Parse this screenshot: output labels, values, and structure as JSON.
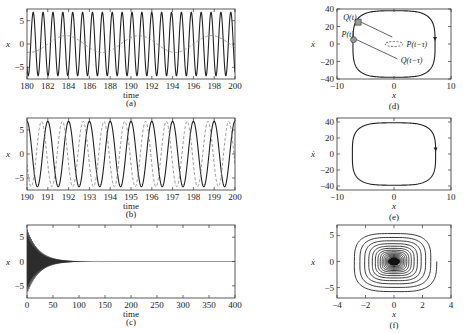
{
  "figure": {
    "width": 465,
    "height": 333
  },
  "chart_data": [
    {
      "id": "a",
      "type": "line",
      "panel_label": "(a)",
      "frame": [
        27,
        9,
        235,
        79
      ],
      "xlabel": "time",
      "ylabel": "x",
      "xlim": [
        180,
        200
      ],
      "ylim": [
        -7.5,
        7.5
      ],
      "xticks": [
        180,
        182,
        184,
        186,
        188,
        190,
        192,
        194,
        196,
        198,
        200
      ],
      "yticks": [
        -5,
        0,
        5
      ],
      "series": [
        {
          "name": "x(t)",
          "style": "solid",
          "amplitude": 6.8,
          "period": 0.95,
          "phase": 0.15
        },
        {
          "name": "delayed / reference",
          "style": "dashed",
          "amplitude": 1.8,
          "period": 7.0,
          "phase": 0.0
        }
      ]
    },
    {
      "id": "b",
      "type": "line",
      "panel_label": "(b)",
      "frame": [
        27,
        118,
        235,
        190
      ],
      "xlabel": "time",
      "ylabel": "x",
      "xlim": [
        190,
        200
      ],
      "ylim": [
        -7.5,
        7.5
      ],
      "xticks": [
        190,
        191,
        192,
        193,
        194,
        195,
        196,
        197,
        198,
        199,
        200
      ],
      "yticks": [
        -5,
        0,
        5
      ],
      "series": [
        {
          "name": "x(t)",
          "style": "solid",
          "amplitude": 6.8,
          "period": 1.0,
          "phase": 0.25
        },
        {
          "name": "x(t-τ)",
          "style": "dashed",
          "amplitude": 6.8,
          "period": 1.0,
          "phase": 0.55
        }
      ]
    },
    {
      "id": "c",
      "type": "line",
      "panel_label": "(c)",
      "frame": [
        27,
        225,
        235,
        298
      ],
      "xlabel": "time",
      "ylabel": "x",
      "xlim": [
        0,
        400
      ],
      "ylim": [
        -7.5,
        7.5
      ],
      "xticks": [
        0,
        50,
        100,
        150,
        200,
        250,
        300,
        350,
        400
      ],
      "yticks": [
        -5,
        0,
        5
      ],
      "series": [
        {
          "name": "x(t) decaying",
          "style": "solid",
          "amplitude": 6.8,
          "decay": 0.045,
          "period": 1.0
        }
      ]
    },
    {
      "id": "d",
      "type": "phase-portrait",
      "panel_label": "(d)",
      "frame": [
        337,
        9,
        451,
        79
      ],
      "xlabel": "x",
      "ylabel": "ẋ",
      "xlim": [
        -10,
        10
      ],
      "ylim": [
        -40,
        40
      ],
      "xticks": [
        -10,
        0,
        10
      ],
      "yticks": [
        -40,
        -20,
        0,
        20,
        40
      ],
      "annotations": [
        {
          "text": "Q(t)",
          "x": -8.9,
          "y": 27
        },
        {
          "text": "P(t)",
          "x": -9.2,
          "y": 8
        },
        {
          "text": "P(t−τ)",
          "x": 2.2,
          "y": -3
        },
        {
          "text": "Q(t−τ)",
          "x": 1.2,
          "y": -22
        }
      ],
      "limit_cycle": {
        "a": 7.2,
        "b": 38
      }
    },
    {
      "id": "e",
      "type": "phase-portrait",
      "panel_label": "(e)",
      "frame": [
        337,
        118,
        451,
        190
      ],
      "xlabel": "x",
      "ylabel": "ẋ",
      "xlim": [
        -10,
        10
      ],
      "ylim": [
        -45,
        45
      ],
      "xticks": [
        -10,
        0,
        10
      ],
      "yticks": [
        -40,
        -20,
        0,
        20,
        40
      ],
      "limit_cycle": {
        "a": 7.3,
        "b": 39
      }
    },
    {
      "id": "f",
      "type": "phase-portrait",
      "panel_label": "(f)",
      "frame": [
        337,
        225,
        451,
        298
      ],
      "xlabel": "x",
      "ylabel": "ẋ",
      "xlim": [
        -4,
        4
      ],
      "ylim": [
        -7,
        7
      ],
      "xticks": [
        -4,
        -2,
        0,
        2,
        4
      ],
      "yticks": [
        -5,
        0,
        5
      ],
      "spiral": {
        "a0": 3.0,
        "b0": 6.0,
        "turns": 14,
        "shrink": 0.86
      }
    }
  ]
}
